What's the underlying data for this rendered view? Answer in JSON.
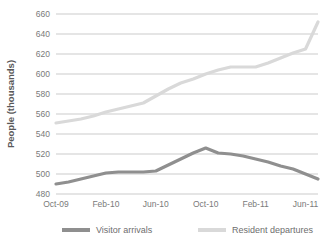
{
  "chart_data": {
    "type": "line",
    "title": "",
    "xlabel": "",
    "ylabel": "People (thousands)",
    "ylim": [
      480,
      660
    ],
    "ytick_step": 20,
    "yticks": [
      480,
      500,
      520,
      540,
      560,
      580,
      600,
      620,
      640,
      660
    ],
    "ytick_labels": [
      "480",
      "500",
      "520",
      "540",
      "560",
      "580",
      "600",
      "620",
      "640",
      "660"
    ],
    "x": [
      "Oct-09",
      "Nov-09",
      "Dec-09",
      "Jan-10",
      "Feb-10",
      "Mar-10",
      "Apr-10",
      "May-10",
      "Jun-10",
      "Jul-10",
      "Aug-10",
      "Sep-10",
      "Oct-10",
      "Nov-10",
      "Dec-10",
      "Jan-11",
      "Feb-11",
      "Mar-11",
      "Apr-11",
      "May-11",
      "Jun-11",
      "Jul-11"
    ],
    "xtick_labels": [
      "Oct-09",
      "Feb-10",
      "Jun-10",
      "Oct-10",
      "Feb-11",
      "Jun-11"
    ],
    "xtick_indices": [
      0,
      4,
      8,
      12,
      16,
      20
    ],
    "grid": "horizontal",
    "legend_position": "bottom",
    "series": [
      {
        "name": "Visitor arrivals",
        "color": "#8f8f8f",
        "line_width": 3.2,
        "values": [
          490,
          492,
          495,
          498,
          501,
          502,
          502,
          502,
          503,
          509,
          515,
          521,
          526,
          521,
          520,
          518,
          515,
          512,
          508,
          505,
          500,
          495
        ]
      },
      {
        "name": "Resident departures",
        "color": "#d9d9d9",
        "line_width": 3.2,
        "values": [
          551,
          553,
          555,
          558,
          562,
          565,
          568,
          571,
          578,
          585,
          591,
          595,
          600,
          604,
          607,
          607,
          607,
          611,
          616,
          621,
          625,
          652
        ]
      }
    ]
  },
  "legend": {
    "items": [
      {
        "label": "Visitor arrivals",
        "color": "#8f8f8f"
      },
      {
        "label": "Resident departures",
        "color": "#d9d9d9"
      }
    ]
  },
  "colors": {
    "gridline": "#b5b5b5",
    "text": "#6e6e6e",
    "axis_title": "#595959",
    "background": "#ffffff"
  }
}
